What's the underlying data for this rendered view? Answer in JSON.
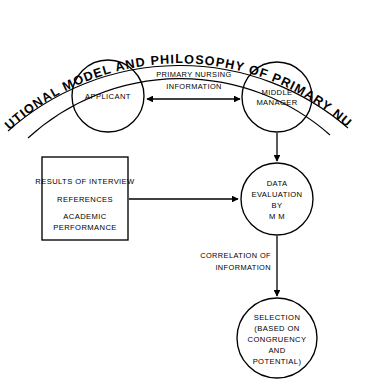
{
  "figure": {
    "title": "INSTITUTIONAL MODEL AND PHILOSOPHY OF PRIMARY NURSING",
    "ink_color": "#000000",
    "background_color": "#ffffff"
  },
  "nodes": {
    "applicant": {
      "lines": [
        "APPLICANT"
      ]
    },
    "middle_manager": {
      "lines": [
        "MIDDLE",
        "MANAGER"
      ]
    },
    "data_evaluation": {
      "lines": [
        "DATA",
        "EVALUATION",
        "BY",
        "M M"
      ]
    },
    "selection": {
      "lines": [
        "SELECTION",
        "(BASED ON",
        "CONGRUENCY",
        "AND",
        "POTENTIAL)"
      ]
    },
    "inputs_box": {
      "lines": [
        "RESULTS OF INTERVIEW",
        "REFERENCES",
        "ACADEMIC",
        "PERFORMANCE"
      ]
    }
  },
  "edges": {
    "primary_nursing_information": {
      "lines": [
        "PRIMARY NURSING",
        "INFORMATION"
      ]
    },
    "correlation_of_information": {
      "lines": [
        "CORRELATION OF",
        "INFORMATION"
      ]
    }
  }
}
